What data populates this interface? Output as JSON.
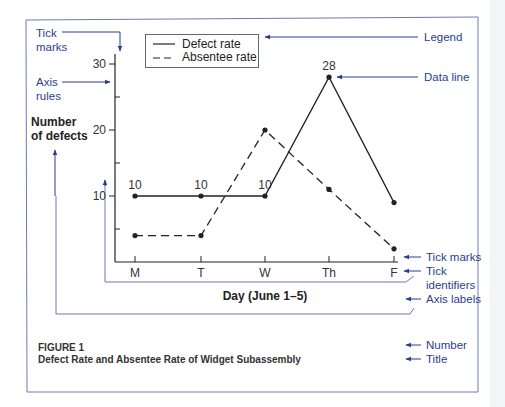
{
  "colors": {
    "annotation": "#2b3d8f",
    "frame": "#6a7bb5",
    "ink": "#222222",
    "background": "#ffffff"
  },
  "annotations": {
    "tick_marks_top": [
      "Tick",
      "marks"
    ],
    "axis_rules": [
      "Axis",
      "rules"
    ],
    "legend": "Legend",
    "data_line": "Data line",
    "tick_marks_bottom": "Tick marks",
    "tick_identifiers": [
      "Tick",
      "identifiers"
    ],
    "axis_labels": "Axis labels",
    "number": "Number",
    "title": "Title"
  },
  "figure": {
    "number": "FIGURE 1",
    "caption": "Defect Rate and Absentee Rate of Widget Subassembly"
  },
  "chart_data": {
    "type": "line",
    "title": "Defect Rate and Absentee Rate of Widget Subassembly",
    "xlabel": "Day (June 1–5)",
    "ylabel": [
      "Number",
      "of defects"
    ],
    "categories": [
      "M",
      "T",
      "W",
      "Th",
      "F"
    ],
    "y_ticks": [
      10,
      20,
      30
    ],
    "y_minor_ticks": [
      5,
      15,
      25
    ],
    "ylim": [
      0,
      32
    ],
    "grid": false,
    "legend_position": "top-left inside",
    "series": [
      {
        "name": "Defect rate",
        "style": "solid",
        "values": [
          10,
          10,
          10,
          28,
          9
        ],
        "data_labels": [
          "10",
          "10",
          "10",
          "28",
          ""
        ]
      },
      {
        "name": "Absentee rate",
        "style": "dashed",
        "values": [
          4,
          4,
          20,
          11,
          2
        ]
      }
    ]
  }
}
